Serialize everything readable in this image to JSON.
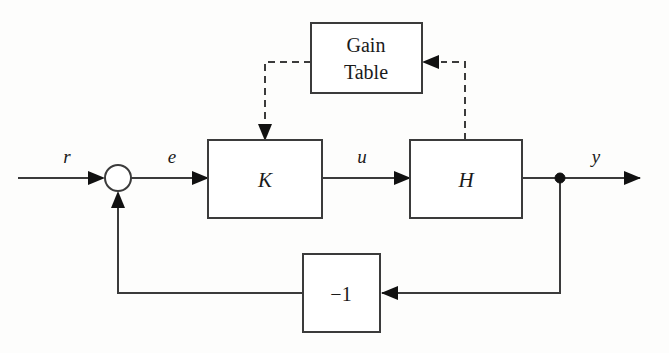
{
  "figure": {
    "background_color": "#fdfdfc",
    "line_color": "#3b3b3b",
    "text_color": "#1a1a1a"
  },
  "blocks": [
    {
      "id": "gain-table",
      "label_line1": "Gain",
      "label_line2": "Table",
      "style": "upright",
      "x": 311,
      "y": 23,
      "width": 111,
      "height": 70
    },
    {
      "id": "controller",
      "label": "K",
      "style": "italic",
      "x": 208,
      "y": 140,
      "width": 114,
      "height": 78
    },
    {
      "id": "plant",
      "label": "H",
      "style": "italic",
      "x": 410,
      "y": 140,
      "width": 112,
      "height": 78
    },
    {
      "id": "feedback-gain",
      "label": "−1",
      "style": "upright",
      "x": 303,
      "y": 254,
      "width": 77,
      "height": 78
    }
  ],
  "signals": [
    {
      "id": "reference",
      "label": "r",
      "x": 67,
      "y": 163
    },
    {
      "id": "error",
      "label": "e",
      "x": 172,
      "y": 163
    },
    {
      "id": "control",
      "label": "u",
      "x": 362,
      "y": 163
    },
    {
      "id": "output",
      "label": "y",
      "x": 596,
      "y": 163
    }
  ],
  "junctions": [
    {
      "id": "summing-junction",
      "type": "circle",
      "cx": 118,
      "cy": 178,
      "r": 13
    },
    {
      "id": "output-takeoff-node",
      "type": "dot",
      "cx": 560,
      "cy": 178,
      "r": 5
    }
  ],
  "connections": [
    {
      "id": "reference-to-sum",
      "from": "input",
      "to": "summing-junction",
      "style": "solid"
    },
    {
      "id": "sum-to-controller",
      "from": "summing-junction",
      "to": "controller",
      "style": "solid"
    },
    {
      "id": "controller-to-plant",
      "from": "controller",
      "to": "plant",
      "style": "solid"
    },
    {
      "id": "plant-to-output",
      "from": "plant",
      "to": "output",
      "style": "solid"
    },
    {
      "id": "output-to-feedback-gain",
      "from": "output-takeoff-node",
      "to": "feedback-gain",
      "style": "solid"
    },
    {
      "id": "feedback-gain-to-sum",
      "from": "feedback-gain",
      "to": "summing-junction",
      "style": "solid"
    },
    {
      "id": "plant-to-gain-table",
      "from": "plant",
      "to": "gain-table",
      "style": "dashed"
    },
    {
      "id": "gain-table-to-controller",
      "from": "gain-table",
      "to": "controller",
      "style": "dashed"
    }
  ]
}
